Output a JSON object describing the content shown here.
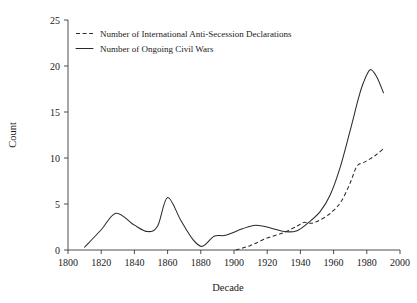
{
  "chart_data": {
    "type": "line",
    "title": "",
    "xlabel": "Decade",
    "ylabel": "Count",
    "xlim": [
      1800,
      2000
    ],
    "ylim": [
      0,
      25
    ],
    "grid": false,
    "legend_position": "top-left",
    "xticks": [
      1800,
      1820,
      1840,
      1860,
      1880,
      1900,
      1920,
      1940,
      1960,
      1980,
      2000
    ],
    "xtick_labels": [
      "1800",
      "1820",
      "1840",
      "1860",
      "1880",
      "1900",
      "1920",
      "1940",
      "1960",
      "1980",
      "2000"
    ],
    "yticks": [
      0,
      5,
      10,
      15,
      20,
      25
    ],
    "ytick_labels": [
      "0",
      "5",
      "10",
      "15",
      "20",
      "25"
    ],
    "series": [
      {
        "name": "Number of International Anti-Secession Declarations",
        "style": "dashed",
        "x": [
          1901,
          1910,
          1920,
          1930,
          1938,
          1942,
          1946,
          1950,
          1955,
          1960,
          1965,
          1970,
          1974,
          1978,
          1982,
          1986,
          1990
        ],
        "values": [
          0,
          0.5,
          1.3,
          1.9,
          2.6,
          3.0,
          2.9,
          3.1,
          3.6,
          4.3,
          5.4,
          7.3,
          9.1,
          9.5,
          9.9,
          10.4,
          11.0
        ]
      },
      {
        "name": "Number of Ongoing Civil Wars",
        "style": "solid",
        "x": [
          1810,
          1820,
          1829,
          1840,
          1848,
          1854,
          1860,
          1868,
          1875,
          1881,
          1888,
          1895,
          1905,
          1913,
          1922,
          1930,
          1938,
          1945,
          1952,
          1958,
          1964,
          1970,
          1975,
          1978,
          1982,
          1986,
          1990
        ],
        "values": [
          0.3,
          2.2,
          4.0,
          2.7,
          2.0,
          2.6,
          5.7,
          3.2,
          1.2,
          0.4,
          1.5,
          1.6,
          2.3,
          2.7,
          2.4,
          2.0,
          2.1,
          3.0,
          4.2,
          6.0,
          9.0,
          13.0,
          16.5,
          18.2,
          19.6,
          18.8,
          17.1
        ]
      }
    ]
  },
  "legend": {
    "entries": [
      {
        "label": "Number of International Anti-Secession Declarations",
        "style": "dashed"
      },
      {
        "label": "Number of Ongoing Civil Wars",
        "style": "solid"
      }
    ]
  },
  "axes": {
    "x_title": "Decade",
    "y_title": "Count"
  },
  "colors": {
    "line": "#2b2b2b",
    "axis": "#3a3a3a",
    "background": "#ffffff",
    "text": "#1a1a1a"
  }
}
